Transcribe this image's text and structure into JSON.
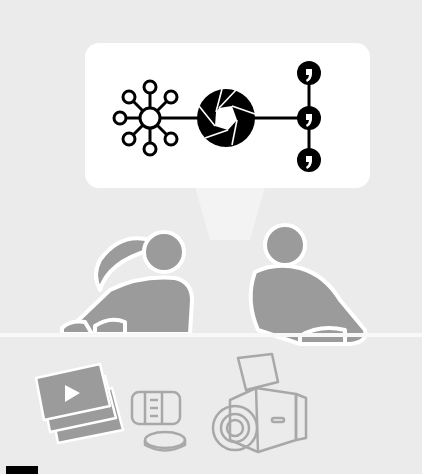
{
  "illustration": {
    "description": "Two people at a table discussing; speech bubble shows network hub connected to camera aperture connected to three comment nodes; photos, lens, lens cap and medium-format camera below",
    "colors": {
      "background": "#ebebeb",
      "bubble": "#ffffff",
      "icon": "#000000",
      "figure": "#9b9b9b",
      "outline": "#ffffff"
    },
    "bubble_icons": [
      "network-hub-icon",
      "camera-aperture-icon",
      "comment-node-icon",
      "comment-node-icon",
      "comment-node-icon"
    ],
    "people": [
      "woman-with-ponytail",
      "man"
    ],
    "objects": [
      "photo-stack-icon",
      "lens-icon",
      "lens-cap-icon",
      "medium-format-camera-icon"
    ]
  }
}
